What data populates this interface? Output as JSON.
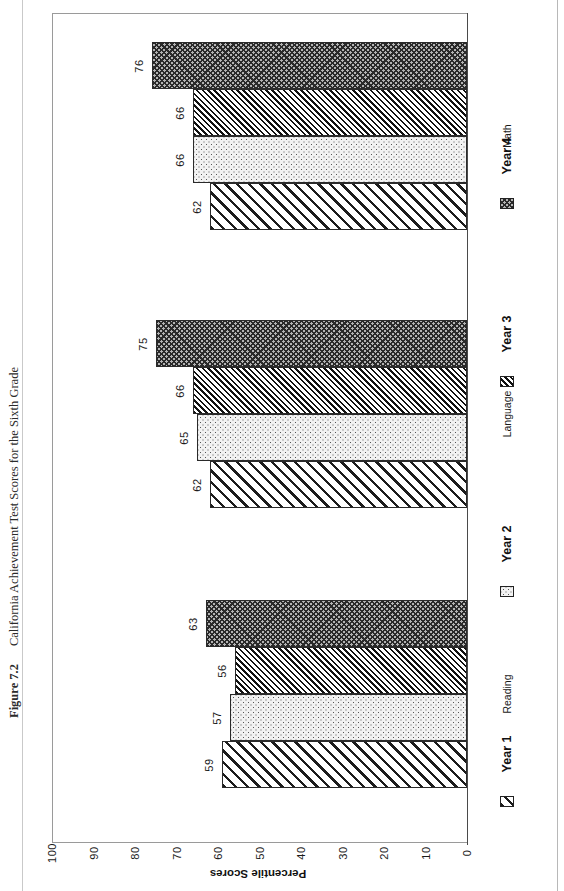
{
  "figure": {
    "number": "Figure 7.2",
    "title": "California Achievement Test Scores for the Sixth Grade"
  },
  "chart_data": {
    "type": "bar",
    "orientation": "horizontal",
    "title": "California Achievement Test Scores for the Sixth Grade",
    "xlabel": "",
    "ylabel": "Percentile Scores",
    "ylim": [
      0,
      100
    ],
    "grid": false,
    "legend_position": "bottom",
    "categories": [
      "Reading",
      "Language",
      "Math"
    ],
    "tick_labels": [
      "100",
      "90",
      "80",
      "70",
      "60",
      "50",
      "40",
      "30",
      "20",
      "10",
      "0"
    ],
    "tick_values": [
      100,
      90,
      80,
      70,
      60,
      50,
      40,
      30,
      20,
      10,
      0
    ],
    "series": [
      {
        "name": "Year 1",
        "pattern": "diagonal-hatch-wide",
        "values": [
          59,
          62,
          62
        ]
      },
      {
        "name": "Year 2",
        "pattern": "dotted-stipple",
        "values": [
          57,
          65,
          66
        ]
      },
      {
        "name": "Year 3",
        "pattern": "diagonal-hatch-dense",
        "values": [
          56,
          66,
          66
        ]
      },
      {
        "name": "Year 4",
        "pattern": "crosshatch-dark",
        "values": [
          63,
          75,
          76
        ]
      }
    ],
    "data_labels": {
      "Reading": [
        "59",
        "57",
        "56",
        "63"
      ],
      "Language": [
        "62",
        "65",
        "66",
        "75"
      ],
      "Math": [
        "62",
        "66",
        "66",
        "76"
      ]
    }
  },
  "axis": {
    "value_axis_title": "Percentile Scores",
    "ticks": [
      "100",
      "90",
      "80",
      "70",
      "60",
      "50",
      "40",
      "30",
      "20",
      "10",
      "0"
    ]
  },
  "legend": {
    "items": [
      {
        "label": "Year 1"
      },
      {
        "label": "Year 2"
      },
      {
        "label": "Year 3"
      },
      {
        "label": "Year 4"
      }
    ]
  },
  "category_labels": [
    "Reading",
    "Language",
    "Math"
  ]
}
